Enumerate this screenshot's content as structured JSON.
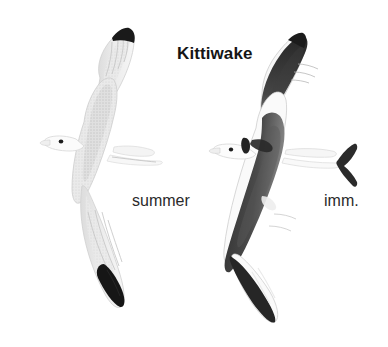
{
  "plate": {
    "title": "Kittiwake",
    "background_color": "#ffffff",
    "width": 388,
    "height": 347,
    "labels": {
      "summer": "summer",
      "immature": "imm."
    },
    "palette": {
      "ink_black": "#161616",
      "dark_grey": "#3a3a3a",
      "mid_grey": "#8d8d8d",
      "pale_grey": "#e4e4e4",
      "faint_grey": "#f1f1f1",
      "outline_grey": "#b9b9b9",
      "text": "#1a1a1a",
      "paper": "#ffffff"
    },
    "figures": [
      {
        "id": "adult-summer",
        "name": "Kittiwake adult summer plumage in flight",
        "label": "summer",
        "orientation": "viewed from below, wings spread vertically, head to the left",
        "marks": [
          "pale grey upperwing",
          "solid black triangular wingtips",
          "white head with small dark eye",
          "white wedge-shaped tail"
        ]
      },
      {
        "id": "immature",
        "name": "Kittiwake immature in flight",
        "label": "imm.",
        "orientation": "viewed from above, wings spread vertically, head to the left",
        "marks": [
          "bold dark W band across wings",
          "dark half collar on nape",
          "dark ear spot",
          "black terminal tail band",
          "black wingtips"
        ]
      }
    ]
  }
}
